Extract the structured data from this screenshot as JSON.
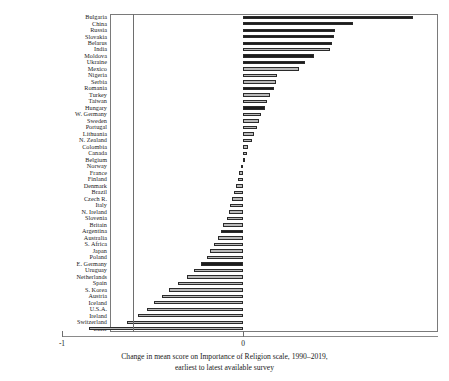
{
  "caption": {
    "line1": "Change in mean score on Importance of Religion scale, 1990–2019,",
    "line2": "earliest to latest available survey"
  },
  "axis": {
    "ticks": [
      {
        "label": "-1",
        "value": -1
      },
      {
        "label": "0",
        "value": 0
      }
    ]
  },
  "chart_data": {
    "type": "bar",
    "orientation": "horizontal",
    "title": "",
    "subtitle": "",
    "xlabel": "Change in mean score on Importance of Religion scale, 1990–2019, earliest to latest available survey",
    "ylabel": "",
    "xlim": [
      -1.0,
      0.98
    ],
    "grid": false,
    "legend": null,
    "zero_reference_line": 0,
    "tick_labels": [
      "-1",
      "0"
    ],
    "note": "Bars alternate dark and light fill shading; sorted from largest increase (top) to largest decrease (bottom).",
    "categories": [
      "Bulgaria",
      "China",
      "Russia",
      "Slovakia",
      "Belarus",
      "India",
      "Moldova",
      "Ukraine",
      "Mexico",
      "Nigeria",
      "Serbia",
      "Romania",
      "Turkey",
      "Taiwan",
      "Hungary",
      "W. Germany",
      "Sweden",
      "Portugal",
      "Lithuania",
      "N. Zealand",
      "Colombia",
      "Canada",
      "Belgium",
      "Norway",
      "France",
      "Finland",
      "Denmark",
      "Brazil",
      "Czech R.",
      "Italy",
      "N. Ireland",
      "Slovenia",
      "Britain",
      "Argentina",
      "Australia",
      "S. Africa",
      "Japan",
      "Poland",
      "E. Germany",
      "Uruguay",
      "Netherlands",
      "Spain",
      "S. Korea",
      "Austria",
      "Iceland",
      "U.S.A.",
      "Ireland",
      "Switzerland",
      "Chile"
    ],
    "values": [
      0.94,
      0.61,
      0.51,
      0.5,
      0.49,
      0.48,
      0.39,
      0.34,
      0.31,
      0.19,
      0.18,
      0.17,
      0.15,
      0.13,
      0.12,
      0.1,
      0.09,
      0.08,
      0.06,
      0.05,
      0.03,
      0.02,
      0.01,
      -0.01,
      -0.02,
      -0.03,
      -0.04,
      -0.05,
      -0.06,
      -0.07,
      -0.08,
      -0.09,
      -0.11,
      -0.12,
      -0.14,
      -0.16,
      -0.18,
      -0.2,
      -0.23,
      -0.27,
      -0.31,
      -0.36,
      -0.41,
      -0.45,
      -0.49,
      -0.53,
      -0.58,
      -0.64,
      -0.85
    ],
    "fills": [
      "dark",
      "dark",
      "dark",
      "dark",
      "dark",
      "light",
      "dark",
      "dark",
      "light",
      "light",
      "light",
      "dark",
      "light",
      "light",
      "dark",
      "light",
      "light",
      "light",
      "light",
      "light",
      "light",
      "light",
      "light",
      "light",
      "light",
      "light",
      "light",
      "light",
      "light",
      "light",
      "light",
      "light",
      "light",
      "dark",
      "light",
      "light",
      "light",
      "light",
      "dark",
      "light",
      "light",
      "light",
      "light",
      "light",
      "light",
      "light",
      "light",
      "light",
      "light"
    ]
  }
}
